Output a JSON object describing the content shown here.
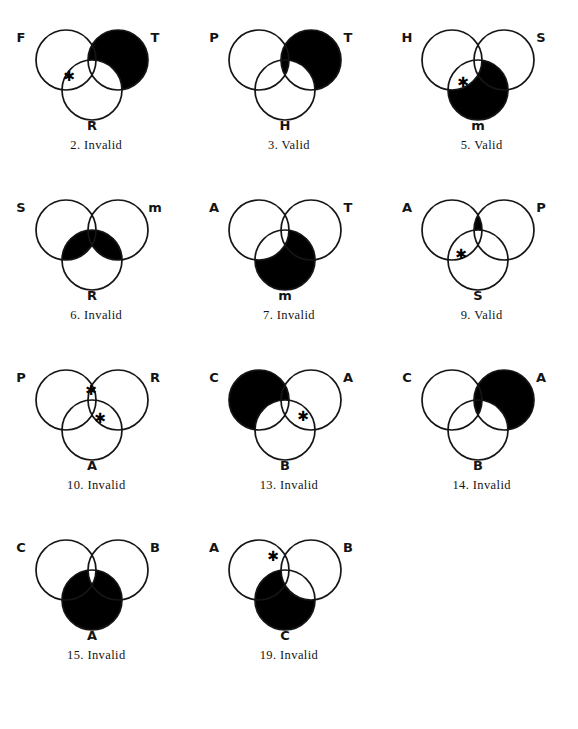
{
  "page": {
    "kind": "logic-worksheet-venn-diagrams",
    "background_color": "#ffffff",
    "ink_color": "#141414",
    "shade_color": "#000000",
    "columns": 3,
    "rows": 4
  },
  "diagrams": [
    {
      "number": "2.",
      "verdict": "Invalid",
      "caption": "2. Invalid",
      "labels": {
        "left": "F",
        "right": "T",
        "bottom": "R"
      },
      "x_marks": [
        {
          "cx": 64,
          "cy": 62
        }
      ],
      "shading": "right-circle-minus-bottom",
      "shading_note": "T circle filled black except where it overlaps R"
    },
    {
      "number": "3.",
      "verdict": "Valid",
      "caption": "3. Valid",
      "labels": {
        "left": "P",
        "right": "T",
        "bottom": "H"
      },
      "x_marks": [],
      "shading": "right-circle-plus-left-right-lens",
      "shading_note": "T circle filled black plus hatched P-and-T lens above H"
    },
    {
      "number": "5.",
      "verdict": "Valid",
      "caption": "5. Valid",
      "labels": {
        "left": "H",
        "right": "S",
        "bottom": "m"
      },
      "x_marks": [
        {
          "cx": 72,
          "cy": 68
        }
      ],
      "shading": "bottom-circle-minus-left-lens",
      "shading_note": "m circle filled black except the H-and-m lens which holds the X"
    },
    {
      "number": "6.",
      "verdict": "Invalid",
      "caption": "6. Invalid",
      "labels": {
        "left": "S",
        "right": "m",
        "bottom": "R"
      },
      "x_marks": [],
      "shading": "bottom-circle-top-band",
      "shading_note": "upper band of R where it meets S and m filled black"
    },
    {
      "number": "7.",
      "verdict": "Invalid",
      "caption": "7. Invalid",
      "labels": {
        "left": "A",
        "right": "T",
        "bottom": "m"
      },
      "x_marks": [],
      "shading": "bottom-circle-minus-left-lens",
      "shading_note": "m circle filled black except the A-and-m lens"
    },
    {
      "number": "9.",
      "verdict": "Valid",
      "caption": "9. Valid",
      "labels": {
        "left": "A",
        "right": "P",
        "bottom": "S"
      },
      "x_marks": [
        {
          "cx": 70,
          "cy": 70
        }
      ],
      "shading": "right-lens-minus-bottom",
      "shading_note": "A-and-P lens above S filled black; X sits in A-and-S lens"
    },
    {
      "number": "10.",
      "verdict": "Invalid",
      "caption": "10. Invalid",
      "labels": {
        "left": "P",
        "right": "R",
        "bottom": "A"
      },
      "x_marks": [
        {
          "cx": 86,
          "cy": 36
        },
        {
          "cx": 95,
          "cy": 64
        }
      ],
      "shading": "none",
      "shading_note": "no shaded regions, two X marks"
    },
    {
      "number": "13.",
      "verdict": "Invalid",
      "caption": "13. Invalid",
      "labels": {
        "left": "C",
        "right": "A",
        "bottom": "B"
      },
      "x_marks": [
        {
          "cx": 105,
          "cy": 62
        }
      ],
      "shading": "left-circle-minus-bottom",
      "shading_note": "C circle filled black except where it overlaps B"
    },
    {
      "number": "14.",
      "verdict": "Invalid",
      "caption": "14. Invalid",
      "labels": {
        "left": "C",
        "right": "A",
        "bottom": "B"
      },
      "x_marks": [],
      "shading": "right-circle-minus-bottom-plus-left-lens",
      "shading_note": "A circle filled black except bottom overlap, plus the C-and-A lens"
    },
    {
      "number": "15.",
      "verdict": "Invalid",
      "caption": "15. Invalid",
      "labels": {
        "left": "C",
        "right": "B",
        "bottom": "A"
      },
      "x_marks": [],
      "shading": "bottom-circle-minus-top-wedge",
      "shading_note": "A circle filled black except the small top wedge inside C and B"
    },
    {
      "number": "19.",
      "verdict": "Invalid",
      "caption": "19. Invalid",
      "labels": {
        "left": "A",
        "right": "B",
        "bottom": "C"
      },
      "x_marks": [
        {
          "cx": 75,
          "cy": 32
        }
      ],
      "shading": "bottom-circle-minus-right-lens",
      "shading_note": "C circle filled black except the B-and-C lens"
    }
  ],
  "geometry": {
    "circle_radius": 30,
    "left_center": {
      "cx": 61,
      "cy": 46
    },
    "right_center": {
      "cx": 113,
      "cy": 46
    },
    "bottom_center": {
      "cx": 87,
      "cy": 76
    },
    "label_left": {
      "x": 16,
      "y": 28
    },
    "label_right": {
      "x": 150,
      "y": 28
    },
    "label_bottom": {
      "x": 87,
      "y": 116
    }
  }
}
